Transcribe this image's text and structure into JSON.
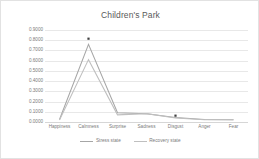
{
  "chart_data": {
    "type": "line",
    "title": "Children's Park",
    "xlabel": "",
    "ylabel": "",
    "categories": [
      "Happiness",
      "Calmness",
      "Surprise",
      "Sadness",
      "Disgust",
      "Anger",
      "Fear"
    ],
    "series": [
      {
        "name": "Stress state",
        "color": "#a6a6a6",
        "values": [
          0.025,
          0.76,
          0.09,
          0.08,
          0.045,
          0.025,
          0.022
        ]
      },
      {
        "name": "Recovery state",
        "color": "#bfbfbf",
        "values": [
          0.02,
          0.61,
          0.07,
          0.082,
          0.04,
          0.023,
          0.021
        ]
      }
    ],
    "markers": [
      {
        "label": "Calmness peak marker",
        "category": "Calmness",
        "value": 0.815,
        "color": "#404040"
      },
      {
        "label": "Disgust marker",
        "category": "Disgust",
        "value": 0.062,
        "color": "#404040"
      }
    ],
    "ylim": [
      0.0,
      0.9
    ],
    "ytick_values": [
      0.9,
      0.8,
      0.7,
      0.6,
      0.5,
      0.4,
      0.3,
      0.2,
      0.1,
      0.0
    ],
    "ytick_labels": [
      "0.9000",
      "0.8000",
      "0.7000",
      "0.6000",
      "0.5000",
      "0.4000",
      "0.3000",
      "0.2000",
      "0.1000",
      "0.0000"
    ],
    "grid": true,
    "grid_color": "#e8e8e8",
    "legend_position": "bottom",
    "plot_background": "#ffffff",
    "text_color": "#7a7a7a",
    "title_color": "#595959",
    "border_color": "#e2e2e2"
  }
}
